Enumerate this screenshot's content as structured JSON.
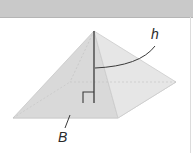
{
  "figure": {
    "type": "square-pyramid",
    "labels": {
      "height": "h",
      "base": "B"
    },
    "colors": {
      "header_band": "#c9c9c9",
      "face_fill": "#dedede",
      "face_shade": "#d2d2d2",
      "edge": "#c4c4c4",
      "height_line": "#3a3a3a",
      "label": "#2a2a2a"
    }
  }
}
